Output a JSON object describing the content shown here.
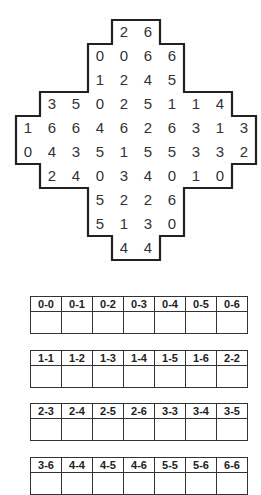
{
  "puzzle": {
    "grid_origin": [
      16,
      20
    ],
    "cell_size": 24,
    "rows": [
      {
        "start_col": 4,
        "values": [
          "2",
          "6"
        ]
      },
      {
        "start_col": 3,
        "values": [
          "0",
          "0",
          "6",
          "6"
        ]
      },
      {
        "start_col": 3,
        "values": [
          "1",
          "2",
          "4",
          "5"
        ]
      },
      {
        "start_col": 1,
        "values": [
          "3",
          "5",
          "0",
          "2",
          "5",
          "1",
          "1",
          "4"
        ]
      },
      {
        "start_col": 0,
        "values": [
          "1",
          "6",
          "6",
          "4",
          "6",
          "2",
          "6",
          "3",
          "1",
          "3"
        ]
      },
      {
        "start_col": 0,
        "values": [
          "0",
          "4",
          "3",
          "5",
          "1",
          "5",
          "5",
          "3",
          "3",
          "2"
        ]
      },
      {
        "start_col": 1,
        "values": [
          "2",
          "4",
          "0",
          "3",
          "4",
          "0",
          "1",
          "0"
        ]
      },
      {
        "start_col": 3,
        "values": [
          "5",
          "2",
          "2",
          "6"
        ]
      },
      {
        "start_col": 3,
        "values": [
          "5",
          "1",
          "3",
          "0"
        ]
      },
      {
        "start_col": 4,
        "values": [
          "4",
          "4"
        ]
      }
    ]
  },
  "domino_tables": [
    {
      "top": 296,
      "labels": [
        "0-0",
        "0-1",
        "0-2",
        "0-3",
        "0-4",
        "0-5",
        "0-6"
      ]
    },
    {
      "top": 350,
      "labels": [
        "1-1",
        "1-2",
        "1-3",
        "1-4",
        "1-5",
        "1-6",
        "2-2"
      ]
    },
    {
      "top": 403,
      "labels": [
        "2-3",
        "2-4",
        "2-5",
        "2-6",
        "3-3",
        "3-4",
        "3-5"
      ]
    },
    {
      "top": 457,
      "labels": [
        "3-6",
        "4-4",
        "4-5",
        "4-6",
        "5-5",
        "5-6",
        "6-6"
      ]
    }
  ],
  "colors": {
    "border": "#222222",
    "text": "#333333"
  }
}
